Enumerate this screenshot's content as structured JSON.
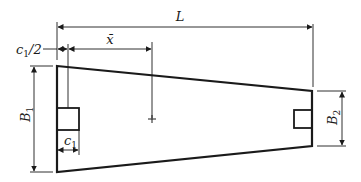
{
  "diagram": {
    "type": "trapezoidal combined footing plan",
    "colors": {
      "stroke": "#1a1a1a",
      "background": "#ffffff"
    },
    "labels": {
      "L": "L",
      "x_bar": "x̄",
      "c1_half_main": "c",
      "c1_half_sub": "1",
      "c1_half_suffix": "/2",
      "c1_main": "c",
      "c1_sub": "1",
      "B1_main": "B",
      "B1_sub": "1",
      "B2_main": "B",
      "B2_sub": "2"
    },
    "elements": [
      "footing-outline",
      "left-column",
      "right-column",
      "centroid-marker",
      "dimension-L",
      "dimension-x-bar",
      "dimension-c1-half",
      "dimension-c1",
      "dimension-B1",
      "dimension-B2"
    ]
  }
}
